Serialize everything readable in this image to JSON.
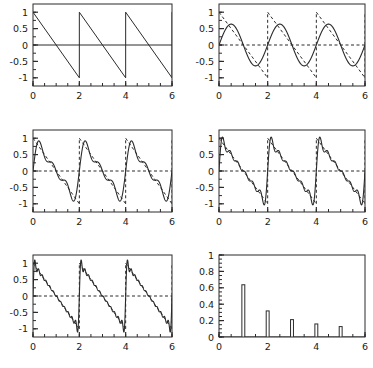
{
  "figure": {
    "title": "",
    "background": "#ffffff",
    "line_color": "#2b2b2b",
    "panel_rows": 3,
    "panel_cols": 2
  },
  "chart_data": [
    {
      "type": "line",
      "name": "panel-1-sawtooth",
      "title": "",
      "xlabel": "",
      "ylabel": "",
      "xlim": [
        0,
        6
      ],
      "ylim": [
        -1.25,
        1.25
      ],
      "xticks": [
        0,
        2,
        4,
        6
      ],
      "xticklabels": [
        "0",
        "2",
        "4",
        "6"
      ],
      "xminor_step": 0.5,
      "yticks": [
        -1,
        -0.5,
        0,
        0.5,
        1
      ],
      "yticklabels": [
        "-1",
        "-0.5",
        "0",
        "0.5",
        "1"
      ],
      "yminor_step": 0.25,
      "grid": false,
      "legend": "none",
      "series": [
        {
          "name": "sawtooth",
          "style": "solid",
          "description": "descending sawtooth, period 2, from +1 to -1",
          "period": 2,
          "amplitude": 1
        },
        {
          "name": "zero-axis",
          "style": "solid",
          "values": [
            0,
            0
          ]
        }
      ]
    },
    {
      "type": "line",
      "name": "panel-2-fourier-1-term",
      "title": "",
      "xlabel": "",
      "ylabel": "",
      "xlim": [
        0,
        6
      ],
      "ylim": [
        -1.25,
        1.25
      ],
      "xticks": [
        0,
        2,
        4,
        6
      ],
      "xticklabels": [
        "0",
        "2",
        "4",
        "6"
      ],
      "xminor_step": 0.5,
      "yticks": [
        -1,
        -0.5,
        0,
        0.5,
        1
      ],
      "yticklabels": [
        "-1",
        "-0.5",
        "0",
        "0.5",
        "1"
      ],
      "yminor_step": 0.25,
      "grid": false,
      "legend": "none",
      "n_terms": 1,
      "series": [
        {
          "name": "target-sawtooth",
          "style": "dashed"
        },
        {
          "name": "fourier-partial-sum",
          "style": "solid",
          "peak": 0.64
        },
        {
          "name": "zero-axis",
          "style": "dashed",
          "values": [
            0,
            0
          ]
        }
      ]
    },
    {
      "type": "line",
      "name": "panel-3-fourier-3-terms",
      "title": "",
      "xlabel": "",
      "ylabel": "",
      "xlim": [
        0,
        6
      ],
      "ylim": [
        -1.25,
        1.25
      ],
      "xticks": [
        0,
        2,
        4,
        6
      ],
      "xticklabels": [
        "0",
        "2",
        "4",
        "6"
      ],
      "xminor_step": 0.5,
      "yticks": [
        -1,
        -0.5,
        0,
        0.5,
        1
      ],
      "yticklabels": [
        "-1",
        "-0.5",
        "0",
        "0.5",
        "1"
      ],
      "yminor_step": 0.25,
      "grid": false,
      "legend": "none",
      "n_terms": 3,
      "series": [
        {
          "name": "target-sawtooth",
          "style": "dashed"
        },
        {
          "name": "fourier-partial-sum",
          "style": "solid",
          "peak": 0.85
        },
        {
          "name": "zero-axis",
          "style": "dashed",
          "values": [
            0,
            0
          ]
        }
      ]
    },
    {
      "type": "line",
      "name": "panel-4-fourier-6-terms",
      "title": "",
      "xlabel": "",
      "ylabel": "",
      "xlim": [
        0,
        6
      ],
      "ylim": [
        -1.25,
        1.25
      ],
      "xticks": [
        0,
        2,
        4,
        6
      ],
      "xticklabels": [
        "0",
        "2",
        "4",
        "6"
      ],
      "xminor_step": 0.5,
      "yticks": [
        -1,
        -0.5,
        0,
        0.5,
        1
      ],
      "yticklabels": [
        "-1",
        "-0.5",
        "0",
        "0.5",
        "1"
      ],
      "yminor_step": 0.25,
      "grid": false,
      "legend": "none",
      "n_terms": 6,
      "series": [
        {
          "name": "target-sawtooth",
          "style": "dashed"
        },
        {
          "name": "fourier-partial-sum",
          "style": "solid",
          "peak": 0.93
        },
        {
          "name": "zero-axis",
          "style": "dashed",
          "values": [
            0,
            0
          ]
        }
      ]
    },
    {
      "type": "line",
      "name": "panel-5-fourier-12-terms",
      "title": "",
      "xlabel": "",
      "ylabel": "",
      "xlim": [
        0,
        6
      ],
      "ylim": [
        -1.25,
        1.25
      ],
      "xticks": [
        0,
        2,
        4,
        6
      ],
      "xticklabels": [
        "0",
        "2",
        "4",
        "6"
      ],
      "xminor_step": 0.5,
      "yticks": [
        -1,
        -0.5,
        0,
        0.5,
        1
      ],
      "yticklabels": [
        "-1",
        "-0.5",
        "0",
        "0.5",
        "1"
      ],
      "yminor_step": 0.25,
      "grid": false,
      "legend": "none",
      "n_terms": 12,
      "series": [
        {
          "name": "target-sawtooth",
          "style": "dashed"
        },
        {
          "name": "fourier-partial-sum",
          "style": "solid",
          "peak": 1.0
        },
        {
          "name": "zero-axis",
          "style": "dashed",
          "values": [
            0,
            0
          ]
        }
      ]
    },
    {
      "type": "bar",
      "name": "panel-6-spectrum",
      "title": "",
      "xlabel": "",
      "ylabel": "",
      "xlim": [
        0,
        6
      ],
      "ylim": [
        0,
        1
      ],
      "xticks": [
        0,
        2,
        4,
        6
      ],
      "xticklabels": [
        "0",
        "2",
        "4",
        "6"
      ],
      "xminor_step": 0.5,
      "yticks": [
        0,
        0.2,
        0.4,
        0.6,
        0.8,
        1
      ],
      "yticklabels": [
        "0",
        "0.2",
        "0.4",
        "0.6",
        "0.8",
        "1"
      ],
      "yminor_step": 0.05,
      "grid": false,
      "legend": "none",
      "categories": [
        1,
        2,
        3,
        4,
        5
      ],
      "values": [
        0.637,
        0.318,
        0.212,
        0.159,
        0.127
      ],
      "bar_width": 0.12
    }
  ]
}
